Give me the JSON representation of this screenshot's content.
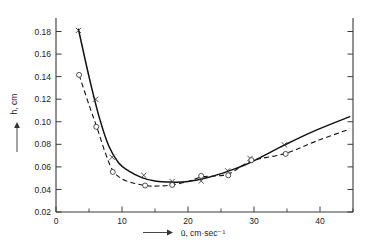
{
  "chart_data": {
    "type": "line",
    "title": "",
    "xlabel": "⟶  ū, cm·sec⁻¹",
    "ylabel": "⟶  h, cm",
    "xlim": [
      0,
      45
    ],
    "ylim": [
      0.015,
      0.192
    ],
    "grid": false,
    "legend_position": "none",
    "xticks": [
      0,
      10,
      20,
      30,
      40
    ],
    "xticklabels": [
      "0",
      "10",
      "20",
      "30",
      "40"
    ],
    "xticks_minor": [
      5,
      15,
      25,
      35,
      45
    ],
    "yticks": [
      0.02,
      0.04,
      0.06,
      0.08,
      0.1,
      0.12,
      0.14,
      0.16,
      0.18
    ],
    "yticklabels": [
      "0.02",
      "0.04",
      "0.06",
      "0.08",
      "0.10",
      "0.12",
      "0.14",
      "0.16",
      "0.18"
    ],
    "series": [
      {
        "name": "solid-curve",
        "style": "solid",
        "marker": "x",
        "x": [
          3.4,
          6.0,
          8.5,
          13.3,
          17.6,
          22.0,
          26.0,
          29.4,
          34.6
        ],
        "y": [
          0.181,
          0.12,
          0.0685,
          0.0525,
          0.047,
          0.0475,
          0.0565,
          0.0675,
          0.0795
        ],
        "curve_x": [
          3.4,
          5.0,
          6.5,
          8.0,
          9.5,
          11.0,
          13.0,
          15.0,
          17.5,
          20.0,
          23.0,
          26.0,
          29.5,
          34.5,
          39.0,
          44.5
        ],
        "curve_y": [
          0.182,
          0.14,
          0.105,
          0.0785,
          0.0635,
          0.0565,
          0.0505,
          0.0475,
          0.0465,
          0.047,
          0.0505,
          0.056,
          0.064,
          0.079,
          0.0915,
          0.1045
        ]
      },
      {
        "name": "dashed-curve",
        "style": "dashed",
        "marker": "o",
        "x": [
          3.5,
          6.1,
          8.6,
          13.5,
          17.6,
          22.0,
          26.1,
          29.6,
          34.8
        ],
        "y": [
          0.1415,
          0.0955,
          0.0555,
          0.0435,
          0.044,
          0.052,
          0.0525,
          0.066,
          0.0715
        ],
        "curve_x": [
          3.5,
          5.0,
          6.2,
          7.5,
          8.7,
          10.5,
          13.5,
          15.5,
          17.6,
          20.0,
          22.0,
          26.0,
          29.5,
          34.8,
          39.5,
          44.5
        ],
        "curve_y": [
          0.1415,
          0.115,
          0.095,
          0.072,
          0.056,
          0.048,
          0.0435,
          0.043,
          0.044,
          0.047,
          0.051,
          0.0535,
          0.065,
          0.072,
          0.083,
          0.0935
        ]
      }
    ]
  },
  "colors": {
    "axis": "#3a3a3a",
    "line": "#111111",
    "marker": "#333333",
    "background": "#ffffff"
  },
  "axis_titles": {
    "x": "ū, cm·sec⁻¹",
    "y": "h, cm"
  }
}
